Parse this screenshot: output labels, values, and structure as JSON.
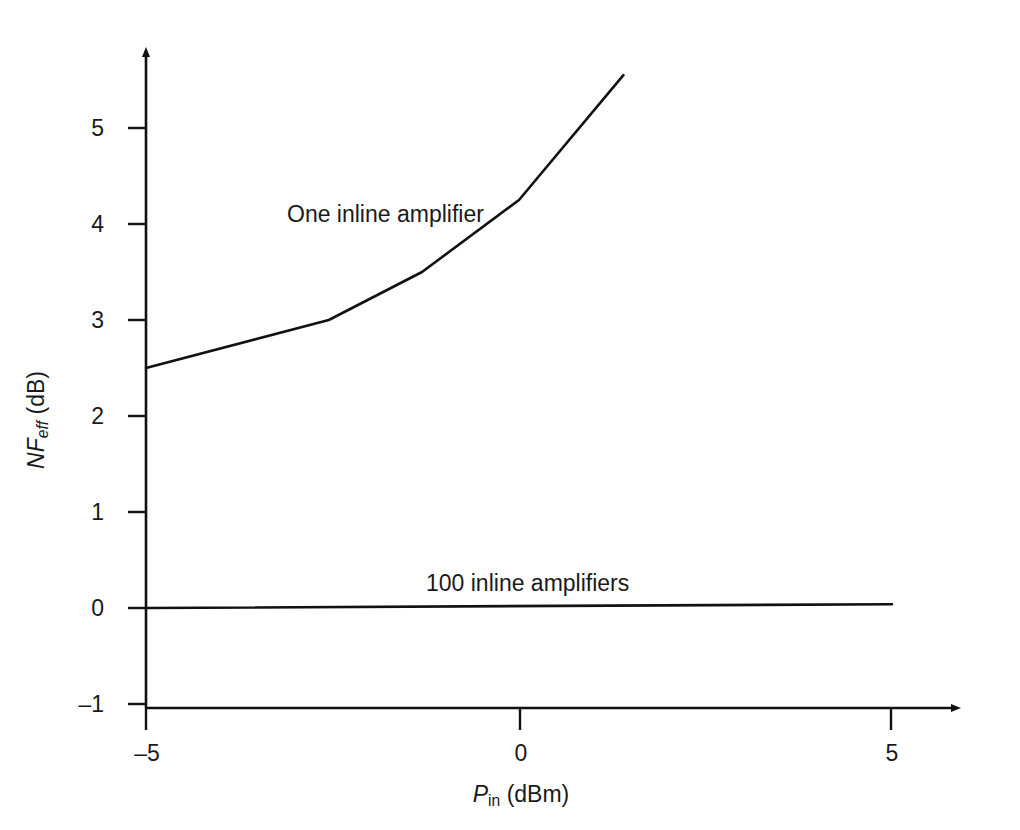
{
  "chart_data": {
    "type": "line",
    "title": "",
    "xlabel": "P_in (dBm)",
    "ylabel": "NF_eff (dB)",
    "xlabel_parts": {
      "symbol": "P",
      "subscript": "in",
      "units": "(dBm)"
    },
    "ylabel_parts": {
      "symbol": "NF",
      "subscript": "eff",
      "units": "(dB)"
    },
    "xlim": [
      -5,
      5.6
    ],
    "ylim": [
      -1,
      5.9
    ],
    "xticks": [
      -5,
      0,
      5
    ],
    "xtick_labels": [
      "–5",
      "0",
      "5"
    ],
    "yticks": [
      -1,
      0,
      1,
      2,
      3,
      4,
      5
    ],
    "ytick_labels": [
      "–1",
      "0",
      "1",
      "2",
      "3",
      "4",
      "5"
    ],
    "grid": false,
    "legend": "inline-annotations",
    "axis_style": "arrowed-spines",
    "line_color": "#111111",
    "background_color": "#ffffff",
    "series": [
      {
        "name": "One inline amplifier",
        "label": "One inline amplifier",
        "label_x": -1.9,
        "label_y": 4.05,
        "x": [
          -5.0,
          -2.55,
          -1.3,
          0.0,
          1.4
        ],
        "y": [
          2.5,
          3.0,
          3.5,
          4.25,
          5.55
        ]
      },
      {
        "name": "100 inline amplifiers",
        "label": "100 inline amplifiers",
        "label_x": 0.1,
        "label_y": 0.45,
        "x": [
          -5.0,
          5.0
        ],
        "y": [
          0.0,
          0.04
        ]
      }
    ]
  },
  "axes": {
    "x_title": "P in (dBm)",
    "y_title": "NF eff (dB)"
  }
}
